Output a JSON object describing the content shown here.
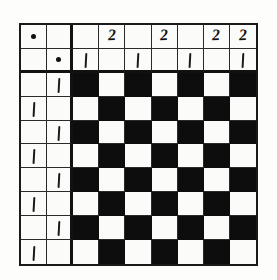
{
  "figure": {
    "name": "checkerboard-grid-puzzle",
    "columns": 9,
    "rows": 10,
    "colors": {
      "paper": "#fdfdfc",
      "cell_light": "#fbfbf9",
      "cell_dark": "#0d0d0d",
      "ink": "#111111",
      "grid_line": "#2a2a2a"
    },
    "thick_divider_after_column": 2,
    "thick_divider_after_row": 2
  },
  "glyphs": {
    "dot": "dot-mark",
    "one": "stroke-one-mark",
    "two": "2"
  },
  "grid": {
    "rows": [
      {
        "index": 1,
        "cells": [
          {
            "col": 1,
            "fill": "light",
            "mark": "dot"
          },
          {
            "col": 2,
            "fill": "light",
            "mark": ""
          },
          {
            "col": 3,
            "fill": "light",
            "mark": ""
          },
          {
            "col": 4,
            "fill": "light",
            "mark": "2"
          },
          {
            "col": 5,
            "fill": "light",
            "mark": ""
          },
          {
            "col": 6,
            "fill": "light",
            "mark": "2"
          },
          {
            "col": 7,
            "fill": "light",
            "mark": ""
          },
          {
            "col": 8,
            "fill": "light",
            "mark": "2"
          },
          {
            "col": 9,
            "fill": "light",
            "mark": "2"
          }
        ]
      },
      {
        "index": 2,
        "cells": [
          {
            "col": 1,
            "fill": "light",
            "mark": ""
          },
          {
            "col": 2,
            "fill": "light",
            "mark": "dot"
          },
          {
            "col": 3,
            "fill": "light",
            "mark": "1"
          },
          {
            "col": 4,
            "fill": "light",
            "mark": ""
          },
          {
            "col": 5,
            "fill": "light",
            "mark": "1"
          },
          {
            "col": 6,
            "fill": "light",
            "mark": ""
          },
          {
            "col": 7,
            "fill": "light",
            "mark": "1"
          },
          {
            "col": 8,
            "fill": "light",
            "mark": ""
          },
          {
            "col": 9,
            "fill": "light",
            "mark": "1"
          }
        ]
      },
      {
        "index": 3,
        "cells": [
          {
            "col": 1,
            "fill": "light",
            "mark": ""
          },
          {
            "col": 2,
            "fill": "light",
            "mark": "1"
          },
          {
            "col": 3,
            "fill": "dark",
            "mark": ""
          },
          {
            "col": 4,
            "fill": "light",
            "mark": ""
          },
          {
            "col": 5,
            "fill": "dark",
            "mark": ""
          },
          {
            "col": 6,
            "fill": "light",
            "mark": ""
          },
          {
            "col": 7,
            "fill": "dark",
            "mark": ""
          },
          {
            "col": 8,
            "fill": "light",
            "mark": ""
          },
          {
            "col": 9,
            "fill": "dark",
            "mark": ""
          }
        ]
      },
      {
        "index": 4,
        "cells": [
          {
            "col": 1,
            "fill": "light",
            "mark": "1"
          },
          {
            "col": 2,
            "fill": "light",
            "mark": ""
          },
          {
            "col": 3,
            "fill": "light",
            "mark": ""
          },
          {
            "col": 4,
            "fill": "dark",
            "mark": ""
          },
          {
            "col": 5,
            "fill": "light",
            "mark": ""
          },
          {
            "col": 6,
            "fill": "dark",
            "mark": ""
          },
          {
            "col": 7,
            "fill": "light",
            "mark": ""
          },
          {
            "col": 8,
            "fill": "dark",
            "mark": ""
          },
          {
            "col": 9,
            "fill": "light",
            "mark": ""
          }
        ]
      },
      {
        "index": 5,
        "cells": [
          {
            "col": 1,
            "fill": "light",
            "mark": ""
          },
          {
            "col": 2,
            "fill": "light",
            "mark": "1"
          },
          {
            "col": 3,
            "fill": "dark",
            "mark": ""
          },
          {
            "col": 4,
            "fill": "light",
            "mark": ""
          },
          {
            "col": 5,
            "fill": "dark",
            "mark": ""
          },
          {
            "col": 6,
            "fill": "light",
            "mark": ""
          },
          {
            "col": 7,
            "fill": "dark",
            "mark": ""
          },
          {
            "col": 8,
            "fill": "light",
            "mark": ""
          },
          {
            "col": 9,
            "fill": "dark",
            "mark": ""
          }
        ]
      },
      {
        "index": 6,
        "cells": [
          {
            "col": 1,
            "fill": "light",
            "mark": "1"
          },
          {
            "col": 2,
            "fill": "light",
            "mark": ""
          },
          {
            "col": 3,
            "fill": "light",
            "mark": ""
          },
          {
            "col": 4,
            "fill": "dark",
            "mark": ""
          },
          {
            "col": 5,
            "fill": "light",
            "mark": ""
          },
          {
            "col": 6,
            "fill": "dark",
            "mark": ""
          },
          {
            "col": 7,
            "fill": "light",
            "mark": ""
          },
          {
            "col": 8,
            "fill": "dark",
            "mark": ""
          },
          {
            "col": 9,
            "fill": "light",
            "mark": ""
          }
        ]
      },
      {
        "index": 7,
        "cells": [
          {
            "col": 1,
            "fill": "light",
            "mark": ""
          },
          {
            "col": 2,
            "fill": "light",
            "mark": "1"
          },
          {
            "col": 3,
            "fill": "dark",
            "mark": ""
          },
          {
            "col": 4,
            "fill": "light",
            "mark": ""
          },
          {
            "col": 5,
            "fill": "dark",
            "mark": ""
          },
          {
            "col": 6,
            "fill": "light",
            "mark": ""
          },
          {
            "col": 7,
            "fill": "dark",
            "mark": ""
          },
          {
            "col": 8,
            "fill": "light",
            "mark": ""
          },
          {
            "col": 9,
            "fill": "dark",
            "mark": ""
          }
        ]
      },
      {
        "index": 8,
        "cells": [
          {
            "col": 1,
            "fill": "light",
            "mark": "1"
          },
          {
            "col": 2,
            "fill": "light",
            "mark": ""
          },
          {
            "col": 3,
            "fill": "light",
            "mark": ""
          },
          {
            "col": 4,
            "fill": "dark",
            "mark": ""
          },
          {
            "col": 5,
            "fill": "light",
            "mark": ""
          },
          {
            "col": 6,
            "fill": "dark",
            "mark": ""
          },
          {
            "col": 7,
            "fill": "light",
            "mark": ""
          },
          {
            "col": 8,
            "fill": "dark",
            "mark": ""
          },
          {
            "col": 9,
            "fill": "light",
            "mark": ""
          }
        ]
      },
      {
        "index": 9,
        "cells": [
          {
            "col": 1,
            "fill": "light",
            "mark": ""
          },
          {
            "col": 2,
            "fill": "light",
            "mark": "1"
          },
          {
            "col": 3,
            "fill": "dark",
            "mark": ""
          },
          {
            "col": 4,
            "fill": "light",
            "mark": ""
          },
          {
            "col": 5,
            "fill": "dark",
            "mark": ""
          },
          {
            "col": 6,
            "fill": "light",
            "mark": ""
          },
          {
            "col": 7,
            "fill": "dark",
            "mark": ""
          },
          {
            "col": 8,
            "fill": "light",
            "mark": ""
          },
          {
            "col": 9,
            "fill": "dark",
            "mark": ""
          }
        ]
      },
      {
        "index": 10,
        "cells": [
          {
            "col": 1,
            "fill": "light",
            "mark": "1"
          },
          {
            "col": 2,
            "fill": "light",
            "mark": ""
          },
          {
            "col": 3,
            "fill": "light",
            "mark": ""
          },
          {
            "col": 4,
            "fill": "dark",
            "mark": ""
          },
          {
            "col": 5,
            "fill": "light",
            "mark": ""
          },
          {
            "col": 6,
            "fill": "dark",
            "mark": ""
          },
          {
            "col": 7,
            "fill": "light",
            "mark": ""
          },
          {
            "col": 8,
            "fill": "dark",
            "mark": ""
          },
          {
            "col": 9,
            "fill": "light",
            "mark": ""
          }
        ]
      }
    ]
  }
}
